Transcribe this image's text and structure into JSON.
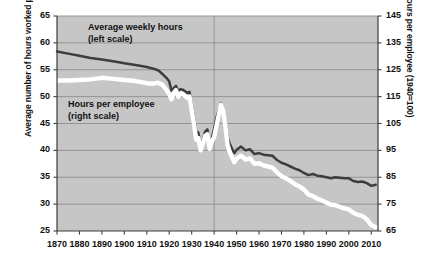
{
  "chart_data": {
    "type": "line",
    "title": "",
    "subtitle": "",
    "xlabel": "",
    "ylabel": "Average number of hours worked per week",
    "ylabel_right": "Hours per employee (1940=100)",
    "grid": true,
    "grid_horizontal": true,
    "grid_vertical_at": [
      1940
    ],
    "legend_position": "inside-plot",
    "xlim": [
      1870,
      2013
    ],
    "xticks": [
      1870,
      1880,
      1890,
      1900,
      1910,
      1920,
      1930,
      1940,
      1950,
      1960,
      1970,
      1980,
      1990,
      2000,
      2010
    ],
    "xtick_labels": [
      "1870",
      "1880",
      "1890",
      "1900",
      "1910",
      "1920",
      "1930",
      "1940",
      "1950",
      "1960",
      "1970",
      "1980",
      "1990",
      "2000",
      "2010"
    ],
    "ylim": [
      25,
      65
    ],
    "yticks": [
      25,
      30,
      35,
      40,
      45,
      50,
      55,
      60,
      65
    ],
    "ytick_labels": [
      "25",
      "30",
      "35",
      "40",
      "45",
      "50",
      "55",
      "60",
      "65"
    ],
    "ylim_right": [
      65,
      145
    ],
    "yticks_right": [
      65,
      75,
      85,
      95,
      105,
      115,
      125,
      135,
      145
    ],
    "ytick_labels_right": [
      "65",
      "75",
      "85",
      "95",
      "105",
      "115",
      "125",
      "135",
      "145"
    ],
    "colors": {
      "series_dark": "#3d3d3d",
      "series_light": "#ffffff",
      "series_light_outline": "#3d3d3d",
      "plot_background": "#c6c6c6",
      "gridline": "#8f8f8f",
      "axis": "#3d3d3d",
      "text": "#111111"
    },
    "series": [
      {
        "name": "Average weekly hours",
        "scale": "left",
        "color": "#3d3d3d",
        "annotation": "Average weekly hours\n(left scale)",
        "x": [
          1870,
          1875,
          1880,
          1885,
          1890,
          1895,
          1900,
          1905,
          1910,
          1913,
          1915,
          1917,
          1919,
          1920,
          1921,
          1922,
          1923,
          1924,
          1925,
          1926,
          1927,
          1928,
          1929,
          1930,
          1931,
          1932,
          1933,
          1934,
          1935,
          1936,
          1937,
          1938,
          1939,
          1940,
          1941,
          1942,
          1943,
          1944,
          1945,
          1946,
          1947,
          1948,
          1949,
          1950,
          1952,
          1954,
          1956,
          1958,
          1960,
          1962,
          1964,
          1966,
          1968,
          1970,
          1972,
          1974,
          1976,
          1978,
          1980,
          1982,
          1984,
          1986,
          1988,
          1990,
          1992,
          1994,
          1996,
          1998,
          2000,
          2002,
          2004,
          2006,
          2008,
          2010,
          2012
        ],
        "y": [
          58.4,
          58.0,
          57.6,
          57.2,
          56.9,
          56.6,
          56.2,
          55.9,
          55.5,
          55.2,
          54.9,
          54.2,
          53.4,
          52.8,
          51.1,
          51.6,
          52.0,
          51.0,
          51.4,
          51.3,
          51.0,
          50.7,
          50.9,
          48.5,
          46.1,
          43.6,
          43.3,
          40.8,
          42.1,
          43.5,
          43.9,
          41.0,
          42.3,
          44.0,
          46.0,
          47.5,
          48.8,
          47.9,
          45.2,
          42.4,
          41.2,
          40.3,
          39.5,
          40.1,
          40.7,
          40.0,
          40.2,
          39.3,
          39.5,
          39.2,
          39.1,
          39.0,
          38.2,
          37.7,
          37.4,
          37.0,
          36.6,
          36.3,
          35.8,
          35.4,
          35.6,
          35.3,
          35.2,
          35.0,
          34.8,
          35.0,
          34.9,
          34.8,
          34.8,
          34.3,
          34.1,
          34.2,
          33.9,
          33.4,
          33.6
        ]
      },
      {
        "name": "Hours per employee",
        "scale": "right",
        "color": "#ffffff",
        "annotation": "Hours per employee\n(right scale)",
        "x": [
          1870,
          1875,
          1880,
          1885,
          1890,
          1895,
          1900,
          1905,
          1910,
          1913,
          1915,
          1917,
          1919,
          1920,
          1921,
          1922,
          1923,
          1924,
          1925,
          1926,
          1927,
          1928,
          1929,
          1930,
          1931,
          1932,
          1933,
          1934,
          1935,
          1936,
          1937,
          1938,
          1939,
          1940,
          1941,
          1942,
          1943,
          1944,
          1945,
          1946,
          1947,
          1948,
          1949,
          1950,
          1952,
          1954,
          1956,
          1958,
          1960,
          1962,
          1964,
          1966,
          1968,
          1970,
          1972,
          1974,
          1976,
          1978,
          1980,
          1982,
          1984,
          1986,
          1988,
          1990,
          1992,
          1994,
          1996,
          1998,
          2000,
          2002,
          2004,
          2006,
          2008,
          2010,
          2012
        ],
        "y": [
          121.0,
          121.0,
          121.2,
          121.4,
          122.0,
          121.6,
          121.2,
          120.8,
          120.0,
          119.8,
          120.2,
          119.4,
          117.2,
          116.0,
          114.0,
          116.4,
          117.4,
          115.0,
          116.2,
          116.0,
          115.2,
          114.6,
          115.0,
          110.0,
          105.0,
          99.0,
          99.6,
          95.0,
          97.6,
          100.4,
          101.0,
          95.6,
          98.4,
          100.0,
          104.0,
          108.0,
          112.0,
          110.0,
          104.0,
          97.0,
          94.2,
          92.4,
          90.6,
          92.0,
          93.0,
          91.6,
          92.0,
          90.0,
          90.2,
          89.4,
          89.0,
          88.6,
          86.8,
          85.4,
          84.6,
          83.6,
          82.4,
          81.6,
          80.4,
          78.6,
          78.0,
          77.0,
          76.4,
          75.6,
          74.8,
          74.6,
          74.0,
          73.4,
          73.0,
          71.8,
          71.0,
          70.6,
          69.4,
          67.2,
          66.4
        ]
      }
    ]
  }
}
